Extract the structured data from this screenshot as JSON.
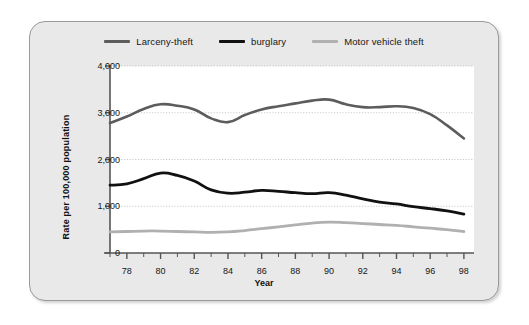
{
  "chart_data": {
    "type": "line",
    "title": "",
    "xlabel": "Year",
    "ylabel": "Rate per 100,000 population",
    "xlim": [
      1977,
      1998.6
    ],
    "ylim": [
      0,
      4000
    ],
    "grid": true,
    "legend_position": "top-center",
    "x_tick_labels": [
      "78",
      "80",
      "82",
      "84",
      "86",
      "88",
      "90",
      "92",
      "94",
      "96",
      "98"
    ],
    "x_tick_values": [
      1978,
      1980,
      1982,
      1984,
      1986,
      1988,
      1990,
      1992,
      1994,
      1996,
      1998
    ],
    "y_tick_labels": [
      "0",
      "1,000",
      "2,000",
      "3,000",
      "4,000"
    ],
    "y_tick_values": [
      0,
      1000,
      2000,
      3000,
      4000
    ],
    "x": [
      1977,
      1978,
      1979,
      1980,
      1981,
      1982,
      1983,
      1984,
      1985,
      1986,
      1987,
      1988,
      1989,
      1990,
      1991,
      1992,
      1993,
      1994,
      1995,
      1996,
      1997,
      1998
    ],
    "series": [
      {
        "name": "Larceny-theft",
        "color": "#5c5c5c",
        "width": 2.6,
        "values": [
          2780,
          2920,
          3080,
          3180,
          3150,
          3070,
          2880,
          2800,
          2950,
          3070,
          3140,
          3200,
          3260,
          3280,
          3180,
          3120,
          3120,
          3140,
          3100,
          2970,
          2730,
          2450
        ]
      },
      {
        "name": "burglary",
        "color": "#111111",
        "width": 2.8,
        "values": [
          1450,
          1480,
          1590,
          1710,
          1660,
          1540,
          1350,
          1280,
          1300,
          1340,
          1320,
          1290,
          1270,
          1290,
          1240,
          1160,
          1090,
          1050,
          990,
          950,
          900,
          830
        ]
      },
      {
        "name": "Motor vehicle theft",
        "color": "#b0b0b0",
        "width": 2.8,
        "values": [
          450,
          460,
          470,
          470,
          460,
          450,
          440,
          450,
          480,
          520,
          560,
          600,
          640,
          660,
          650,
          630,
          610,
          590,
          560,
          530,
          500,
          460
        ]
      }
    ]
  },
  "legend": {
    "items": [
      {
        "label": "Larceny-theft",
        "color": "#5c5c5c"
      },
      {
        "label": "burglary",
        "color": "#111111"
      },
      {
        "label": "Motor vehicle theft",
        "color": "#b0b0b0"
      }
    ]
  },
  "axes": {
    "x_title": "Year",
    "y_title": "Rate per 100,000 population"
  },
  "colors": {
    "card_background": "#e9e9e9",
    "plot_background": "#ffffff",
    "axis": "#555555",
    "gridline": "#bdbdbd",
    "text": "#161616"
  }
}
